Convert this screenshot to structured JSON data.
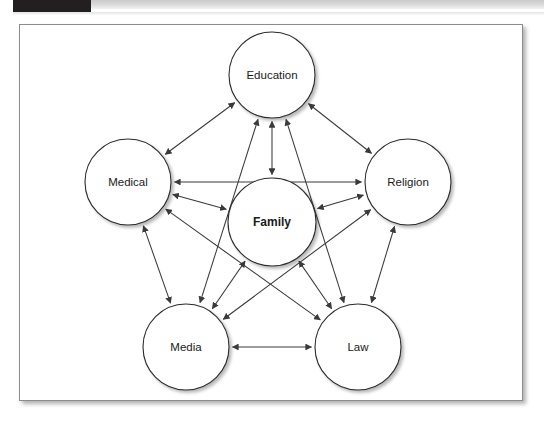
{
  "page": {
    "background_color": "#ffffff",
    "header_band_color": "#231f20",
    "frame_border_color": "#8c8c8c"
  },
  "diagram": {
    "type": "network-diagram",
    "node_fill_color": "#ffffff",
    "node_stroke_color": "#2b2b2b",
    "edge_color": "#3a3a3a",
    "arrow_style": "double-headed",
    "nodes": [
      {
        "id": "education",
        "label": "Education",
        "cx": 272,
        "cy": 75,
        "r": 43,
        "bold": false
      },
      {
        "id": "medical",
        "label": "Medical",
        "cx": 128,
        "cy": 182,
        "r": 43,
        "bold": false
      },
      {
        "id": "religion",
        "label": "Religion",
        "cx": 408,
        "cy": 182,
        "r": 43,
        "bold": false
      },
      {
        "id": "family",
        "label": "Family",
        "cx": 272,
        "cy": 222,
        "r": 44,
        "bold": true
      },
      {
        "id": "media",
        "label": "Media",
        "cx": 186,
        "cy": 347,
        "r": 43,
        "bold": false
      },
      {
        "id": "law",
        "label": "Law",
        "cx": 358,
        "cy": 347,
        "r": 43,
        "bold": false
      }
    ],
    "edges": [
      {
        "from": "education",
        "to": "medical"
      },
      {
        "from": "education",
        "to": "religion"
      },
      {
        "from": "education",
        "to": "family"
      },
      {
        "from": "education",
        "to": "media"
      },
      {
        "from": "education",
        "to": "law"
      },
      {
        "from": "medical",
        "to": "religion"
      },
      {
        "from": "medical",
        "to": "family"
      },
      {
        "from": "medical",
        "to": "media"
      },
      {
        "from": "medical",
        "to": "law"
      },
      {
        "from": "religion",
        "to": "family"
      },
      {
        "from": "religion",
        "to": "media"
      },
      {
        "from": "religion",
        "to": "law"
      },
      {
        "from": "family",
        "to": "media"
      },
      {
        "from": "family",
        "to": "law"
      },
      {
        "from": "media",
        "to": "law"
      }
    ]
  }
}
